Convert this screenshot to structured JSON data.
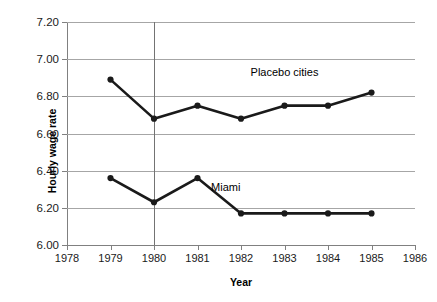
{
  "chart_data": {
    "type": "line",
    "title": "",
    "xlabel": "Year",
    "ylabel": "Hourly wage rate",
    "xlim": [
      1978,
      1986
    ],
    "ylim": [
      6.0,
      7.2
    ],
    "ytick_step": 0.2,
    "grid": true,
    "legend_position": "inline-annotation",
    "x": [
      1979,
      1980,
      1981,
      1982,
      1983,
      1984,
      1985
    ],
    "xticks": [
      "1978",
      "1979",
      "1980",
      "1981",
      "1982",
      "1983",
      "1984",
      "1985",
      "1986"
    ],
    "yticks": [
      "6.00",
      "6.20",
      "6.40",
      "6.60",
      "6.80",
      "7.00",
      "7.20"
    ],
    "series": [
      {
        "name": "Placebo cities",
        "values": [
          6.89,
          6.68,
          6.75,
          6.68,
          6.75,
          6.75,
          6.82
        ],
        "color": "#1a1a1a",
        "label_x": 1983.0,
        "label_y": 6.93
      },
      {
        "name": "Miami",
        "values": [
          6.36,
          6.23,
          6.36,
          6.17,
          6.17,
          6.17,
          6.17
        ],
        "color": "#1a1a1a",
        "label_x": 1981.65,
        "label_y": 6.31
      }
    ],
    "annotations": [
      {
        "name": "policy-reference-line",
        "type": "vertical-line",
        "x": 1980,
        "color": "#737373"
      }
    ]
  }
}
